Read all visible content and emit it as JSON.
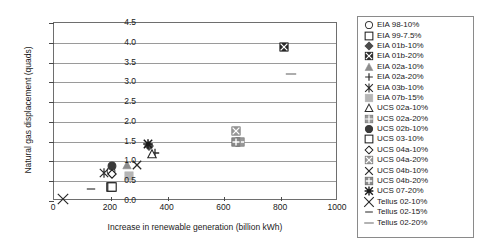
{
  "chart_data": {
    "type": "scatter",
    "title": "",
    "xlabel": "Increase in renewable generation (billion kWh)",
    "ylabel": "Natural gas displacement (quads)",
    "xlim": [
      0,
      1000
    ],
    "ylim": [
      0.0,
      4.5
    ],
    "xticks": [
      "0",
      "200",
      "400",
      "600",
      "800",
      "1000"
    ],
    "xtick_values": [
      0,
      200,
      400,
      600,
      800,
      1000
    ],
    "yticks": [
      "0.0",
      "0.5",
      "1.0",
      "1.5",
      "2.0",
      "2.5",
      "3.0",
      "3.5",
      "4.0",
      "4.5"
    ],
    "ytick_values": [
      0.0,
      0.5,
      1.0,
      1.5,
      2.0,
      2.5,
      3.0,
      3.5,
      4.0,
      4.5
    ],
    "grid": "horizontal",
    "legend_position": "right-outside",
    "series": [
      {
        "name": "EIA 98-10%",
        "marker": "circle-open",
        "color": "#3a3a3a",
        "x": [
          200
        ],
        "y": [
          0.75
        ]
      },
      {
        "name": "EIA 99-7.5%",
        "marker": "square-open",
        "color": "#1a1a1a",
        "x": [
          200
        ],
        "y": [
          0.35
        ]
      },
      {
        "name": "EIA 01b-10%",
        "marker": "diamond-filled",
        "color": "#4a4a4a",
        "x": [
          335
        ],
        "y": [
          1.38
        ]
      },
      {
        "name": "EIA 01b-20%",
        "marker": "square-x-filled",
        "color": "#2a2a2a",
        "x": [
          810
        ],
        "y": [
          3.9
        ]
      },
      {
        "name": "EIA 02a-10%",
        "marker": "triangle-filled",
        "color": "#8c8c8c",
        "x": [
          258
        ],
        "y": [
          0.92
        ]
      },
      {
        "name": "EIA 02a-20%",
        "marker": "plus",
        "color": "#2a2a2a",
        "x": [
          355
        ],
        "y": [
          1.22
        ]
      },
      {
        "name": "EIA 03b-10%",
        "marker": "asterisk",
        "color": "#2a2a2a",
        "x": [
          175
        ],
        "y": [
          0.72
        ]
      },
      {
        "name": "EIA 07b-15%",
        "marker": "square-grey",
        "color": "#b5b5b5",
        "x": [
          265
        ],
        "y": [
          0.62
        ]
      },
      {
        "name": "UCS 02a-10%",
        "marker": "triangle-open",
        "color": "#2a2a2a",
        "x": [
          345
        ],
        "y": [
          1.18
        ]
      },
      {
        "name": "UCS 02a-20%",
        "marker": "square-grid-grey",
        "color": "#9a9a9a",
        "x": [
          655
        ],
        "y": [
          1.5
        ]
      },
      {
        "name": "UCS 02b-10%",
        "marker": "circle-filled",
        "color": "#3a3a3a",
        "x": [
          205
        ],
        "y": [
          0.88
        ]
      },
      {
        "name": "UCS 03-10%",
        "marker": "square-open",
        "color": "#1a1a1a",
        "x": [
          205
        ],
        "y": [
          0.35
        ]
      },
      {
        "name": "UCS 04a-10%",
        "marker": "diamond-open",
        "color": "#1a1a1a",
        "x": [
          205
        ],
        "y": [
          0.68
        ]
      },
      {
        "name": "UCS 04a-20%",
        "marker": "square-x-grey",
        "color": "#8a8a8a",
        "x": [
          640
        ],
        "y": [
          1.78
        ]
      },
      {
        "name": "UCS 04b-10%",
        "marker": "x-mark",
        "color": "#2a2a2a",
        "x": [
          292
        ],
        "y": [
          0.9
        ]
      },
      {
        "name": "UCS 04b-20%",
        "marker": "square-plus-grey",
        "color": "#7a7a7a",
        "x": [
          640
        ],
        "y": [
          1.48
        ]
      },
      {
        "name": "UCS 07-20%",
        "marker": "asterisk-bold",
        "color": "#1a1a1a",
        "x": [
          330
        ],
        "y": [
          1.45
        ]
      },
      {
        "name": "Tellus 02-10%",
        "marker": "x-large",
        "color": "#2a2a2a",
        "x": [
          32
        ],
        "y": [
          0.06
        ]
      },
      {
        "name": "Tellus 02-15%",
        "marker": "dash",
        "color": "#6a6a6a",
        "x": [
          130
        ],
        "y": [
          0.3
        ]
      },
      {
        "name": "Tellus 02-20%",
        "marker": "dash-long",
        "color": "#8a8a8a",
        "x": [
          835
        ],
        "y": [
          3.22
        ]
      }
    ]
  }
}
